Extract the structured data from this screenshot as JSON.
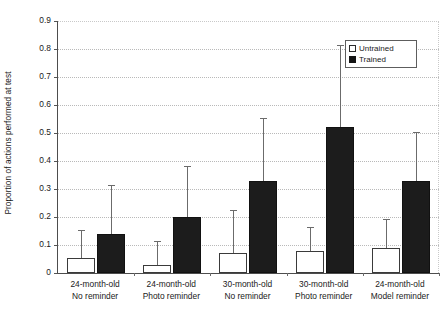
{
  "chart_data": {
    "type": "bar",
    "title": "",
    "subtitle": "",
    "xlabel": "",
    "ylabel": "Proportion of actions performed at test",
    "ylim": [
      0,
      0.9
    ],
    "ytick_labels": [
      "0.9",
      "0.8",
      "0.7",
      "0.6",
      "0.5",
      "0.4",
      "0.3",
      "0.2",
      "0.1",
      "0"
    ],
    "ytick_values": [
      0.9,
      0.8,
      0.7,
      0.6,
      0.5,
      0.4,
      0.3,
      0.2,
      0.1,
      0
    ],
    "grid": "horizontal-dotted",
    "legend_position": "top-right-inside",
    "categories": [
      {
        "line1": "24-month-old",
        "line2": "No reminder"
      },
      {
        "line1": "24-month-old",
        "line2": "Photo reminder"
      },
      {
        "line1": "30-month-old",
        "line2": "No reminder"
      },
      {
        "line1": "30-month-old",
        "line2": "Photo reminder"
      },
      {
        "line1": "24-month-old",
        "line2": "Model reminder"
      }
    ],
    "category_labels": [
      "24-month-old No reminder",
      "24-month-old Photo reminder",
      "30-month-old No reminder",
      "30-month-old Photo reminder",
      "24-month-old Model reminder"
    ],
    "series": [
      {
        "name": "Untrained",
        "color": "#ffffff",
        "edge_color": "#3a3a3a",
        "values": [
          0.055,
          0.03,
          0.07,
          0.08,
          0.09
        ],
        "error_upper": [
          0.15,
          0.11,
          0.22,
          0.16,
          0.19
        ]
      },
      {
        "name": "Trained",
        "color": "#1c1c1c",
        "edge_color": "#111111",
        "values": [
          0.14,
          0.2,
          0.33,
          0.52,
          0.33
        ],
        "error_upper": [
          0.31,
          0.38,
          0.55,
          0.81,
          0.5
        ]
      }
    ]
  },
  "legend": {
    "items": [
      {
        "label": "Untrained",
        "swatch": "open-square"
      },
      {
        "label": "Trained",
        "swatch": "filled-square"
      }
    ]
  }
}
